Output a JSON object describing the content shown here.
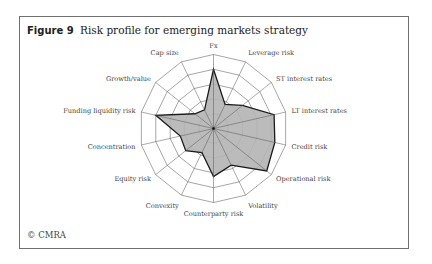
{
  "figure": {
    "number_label": "Figure 9",
    "title": "Risk profile for emerging markets strategy",
    "credit": "© CMRA"
  },
  "chart_data": {
    "type": "radar",
    "title": "Risk profile for emerging markets strategy",
    "categories": [
      "Fx",
      "Leverage risk",
      "ST interest rates",
      "LT interest rates",
      "Credit risk",
      "Operational risk",
      "Volatility",
      "Counterparty risk",
      "Convexity",
      "Equity risk",
      "Concentration",
      "Funding liquidity risk",
      "Growth/value",
      "Cap size"
    ],
    "series": [
      {
        "name": "Emerging markets strategy",
        "values": [
          4.0,
          1.8,
          2.5,
          4.2,
          4.25,
          4.6,
          2.75,
          3.25,
          1.8,
          2.4,
          2.3,
          4.0,
          1.6,
          1.4
        ]
      }
    ],
    "rlim": [
      0,
      5
    ],
    "rings": 5,
    "grid": true,
    "legend": "none",
    "colors": {
      "fill": "#b4b4b4",
      "outline": "#1a1a1a",
      "grid": "#6a6a6a"
    }
  }
}
